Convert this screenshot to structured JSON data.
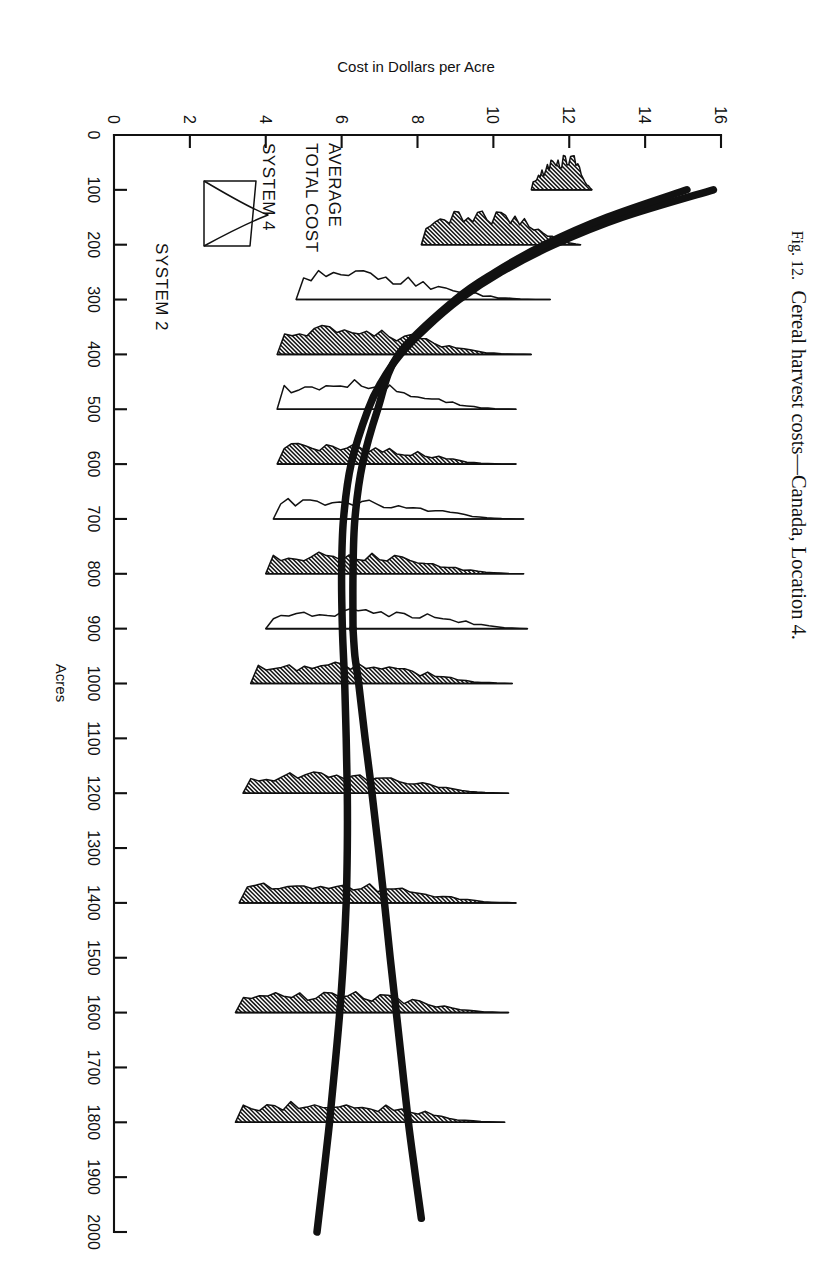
{
  "figure": {
    "caption_prefix": "Fig. 12.",
    "caption_text": "Cereal harvest costs—Canada, Location 4."
  },
  "annotations": [
    {
      "id": "average-total-cost",
      "label_line1": "AVERAGE",
      "label_line2": "TOTAL COST"
    },
    {
      "id": "system-4",
      "label": "SYSTEM 4"
    },
    {
      "id": "system-2",
      "label": "SYSTEM 2"
    }
  ],
  "chart_data": {
    "type": "line",
    "title": "Cereal harvest costs—Canada, Location 4.",
    "xlabel": "Acres",
    "ylabel": "Cost in Dollars per Acre",
    "xlim": [
      0,
      2000
    ],
    "ylim": [
      0,
      16
    ],
    "grid": false,
    "legend": "inline-annotations",
    "xticks": [
      0,
      100,
      200,
      300,
      400,
      500,
      600,
      700,
      800,
      900,
      1000,
      1100,
      1200,
      1300,
      1400,
      1500,
      1600,
      1700,
      1800,
      1900,
      2000
    ],
    "xticklabels": [
      "0",
      "100",
      "200",
      "300",
      "400",
      "500",
      "600",
      "700",
      "800",
      "900",
      "1000",
      "1100",
      "1200",
      "1300",
      "1400",
      "1500",
      "1600",
      "1700",
      "1800",
      "1900",
      "2000"
    ],
    "yticks": [
      0,
      2,
      4,
      6,
      8,
      10,
      12,
      14,
      16
    ],
    "yticklabels": [
      "0",
      "2",
      "4",
      "6",
      "8",
      "10",
      "12",
      "14",
      "16"
    ],
    "series": [
      {
        "name": "SYSTEM 4",
        "note": "average total cost curve, system 4; begins ~900 acres",
        "x": [
          900,
          950,
          1000,
          1100,
          1200,
          1300,
          1400,
          1500,
          1600,
          1700,
          1800,
          1900,
          1975
        ],
        "y": [
          6.3,
          6.35,
          6.45,
          6.62,
          6.8,
          6.97,
          7.13,
          7.28,
          7.44,
          7.6,
          7.76,
          7.95,
          8.1
        ]
      },
      {
        "name": "SYSTEM 2",
        "note": "average total cost curve, system 2; spans 100-2000 acres, minimum near 650-750 acres",
        "x": [
          100,
          150,
          200,
          250,
          300,
          350,
          400,
          450,
          500,
          600,
          700,
          800,
          900,
          1000,
          1100,
          1200,
          1300,
          1400,
          1500,
          1600,
          1700,
          1800,
          1900,
          2000
        ],
        "y": [
          15.8,
          13.4,
          11.6,
          10.2,
          9.1,
          8.25,
          7.55,
          7.05,
          6.7,
          6.25,
          6.05,
          6.0,
          6.02,
          6.08,
          6.12,
          6.15,
          6.15,
          6.12,
          6.05,
          5.95,
          5.82,
          5.68,
          5.52,
          5.35
        ]
      },
      {
        "name": "SYSTEM 4 lower branch",
        "note": "lower of the paired heavy curves at small acreage (system 4 average total cost)",
        "x": [
          100,
          150,
          200,
          250,
          300,
          400,
          500,
          600,
          700,
          800,
          900
        ],
        "y": [
          15.1,
          13.0,
          11.35,
          10.05,
          9.0,
          7.5,
          6.95,
          6.55,
          6.35,
          6.3,
          6.3
        ]
      }
    ],
    "distributions": {
      "note": "Frequency distributions of observed cost per acre, one per acreage class, drawn perpendicular to the cost axis. Alternating hatched / unhatched outlines.",
      "acre_classes": [
        100,
        200,
        300,
        400,
        500,
        600,
        700,
        800,
        900,
        1000,
        1200,
        1400,
        1600,
        1800
      ],
      "hatched": [
        true,
        true,
        false,
        true,
        false,
        true,
        false,
        true,
        false,
        true,
        true,
        true,
        true,
        true
      ],
      "cost_span": [
        [
          11.0,
          12.6
        ],
        [
          8.1,
          12.3
        ],
        [
          4.8,
          11.5
        ],
        [
          4.3,
          11.0
        ],
        [
          4.3,
          10.6
        ],
        [
          4.3,
          10.6
        ],
        [
          4.2,
          10.8
        ],
        [
          4.0,
          10.8
        ],
        [
          4.0,
          10.9
        ],
        [
          3.6,
          10.5
        ],
        [
          3.4,
          10.4
        ],
        [
          3.3,
          10.6
        ],
        [
          3.2,
          10.4
        ],
        [
          3.2,
          10.3
        ]
      ],
      "mode_cost": [
        11.9,
        9.6,
        5.9,
        5.6,
        5.7,
        5.6,
        5.7,
        5.7,
        6.2,
        5.5,
        5.3,
        5.4,
        5.3,
        5.3
      ]
    }
  }
}
